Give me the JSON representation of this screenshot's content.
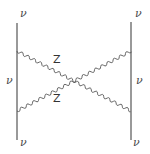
{
  "diagram": {
    "type": "feynman",
    "fermion_lines": [
      {
        "id": "left",
        "x": 17,
        "y1": 23,
        "y2": 140
      },
      {
        "id": "right",
        "x": 131,
        "y1": 22,
        "y2": 140
      }
    ],
    "boson_lines": [
      {
        "id": "z-upper",
        "from": [
          17,
          51
        ],
        "to": [
          131,
          111
        ]
      },
      {
        "id": "z-lower",
        "from": [
          17,
          111
        ],
        "to": [
          131,
          51
        ]
      }
    ],
    "labels": {
      "nu_top_left": "ν",
      "nu_top_right": "ν",
      "nu_mid_left": "ν",
      "nu_mid_right": "ν",
      "nu_bottom_left": "ν",
      "nu_bottom_right": "ν",
      "z_upper": "Z",
      "z_lower": "Z"
    },
    "colors": {
      "line": "#555555",
      "text": "#4a4a4a"
    }
  }
}
